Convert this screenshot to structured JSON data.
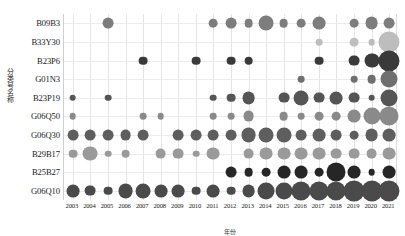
{
  "chart_data": {
    "type": "scatter",
    "title": "",
    "xlabel": "年份",
    "ylabel": "分类号名称",
    "x": [
      "2003",
      "2004",
      "2005",
      "2006",
      "2007",
      "2008",
      "2009",
      "2010",
      "2011",
      "2012",
      "2013",
      "2014",
      "2015",
      "2016",
      "2017",
      "2018",
      "2019",
      "2020",
      "2021"
    ],
    "categories": [
      "B09B3",
      "B33Y30",
      "B23P6",
      "G01N3",
      "B23P19",
      "G06Q50",
      "G06Q30",
      "B29B17",
      "B25B27",
      "G06Q10"
    ],
    "grid": true,
    "legend": null,
    "note": "Bubble size encodes count; bubble darkness encodes series/row grouping.",
    "series": [
      {
        "name": "B09B3",
        "row": 0,
        "color": "#7d7d7d",
        "points": [
          {
            "x": "2005",
            "v": 4
          },
          {
            "x": "2011",
            "v": 3
          },
          {
            "x": "2012",
            "v": 4
          },
          {
            "x": "2013",
            "v": 3
          },
          {
            "x": "2014",
            "v": 6
          },
          {
            "x": "2015",
            "v": 3
          },
          {
            "x": "2016",
            "v": 3
          },
          {
            "x": "2017",
            "v": 5
          },
          {
            "x": "2019",
            "v": 3
          },
          {
            "x": "2020",
            "v": 5
          },
          {
            "x": "2021",
            "v": 4
          }
        ]
      },
      {
        "name": "B33Y30",
        "row": 1,
        "color": "#bdbdbd",
        "points": [
          {
            "x": "2017",
            "v": 2
          },
          {
            "x": "2019",
            "v": 3
          },
          {
            "x": "2020",
            "v": 2
          },
          {
            "x": "2021",
            "v": 9
          }
        ]
      },
      {
        "name": "B23P6",
        "row": 2,
        "color": "#3a3a3a",
        "points": [
          {
            "x": "2007",
            "v": 3
          },
          {
            "x": "2010",
            "v": 3
          },
          {
            "x": "2012",
            "v": 3
          },
          {
            "x": "2013",
            "v": 3
          },
          {
            "x": "2017",
            "v": 3
          },
          {
            "x": "2019",
            "v": 4
          },
          {
            "x": "2020",
            "v": 6
          },
          {
            "x": "2021",
            "v": 9
          }
        ]
      },
      {
        "name": "G01N3",
        "row": 3,
        "color": "#6f6f6f",
        "points": [
          {
            "x": "2016",
            "v": 2
          },
          {
            "x": "2019",
            "v": 2
          },
          {
            "x": "2020",
            "v": 3
          },
          {
            "x": "2021",
            "v": 7
          }
        ]
      },
      {
        "name": "B23P19",
        "row": 4,
        "color": "#555555",
        "points": [
          {
            "x": "2003",
            "v": 2
          },
          {
            "x": "2005",
            "v": 2
          },
          {
            "x": "2011",
            "v": 2
          },
          {
            "x": "2012",
            "v": 3
          },
          {
            "x": "2013",
            "v": 5
          },
          {
            "x": "2015",
            "v": 4
          },
          {
            "x": "2016",
            "v": 6
          },
          {
            "x": "2017",
            "v": 4
          },
          {
            "x": "2018",
            "v": 5
          },
          {
            "x": "2019",
            "v": 4
          },
          {
            "x": "2020",
            "v": 2
          },
          {
            "x": "2021",
            "v": 7
          }
        ]
      },
      {
        "name": "G06Q50",
        "row": 5,
        "color": "#8a8a8a",
        "points": [
          {
            "x": "2003",
            "v": 2
          },
          {
            "x": "2007",
            "v": 2
          },
          {
            "x": "2008",
            "v": 2
          },
          {
            "x": "2011",
            "v": 2
          },
          {
            "x": "2012",
            "v": 2
          },
          {
            "x": "2013",
            "v": 4
          },
          {
            "x": "2015",
            "v": 3
          },
          {
            "x": "2016",
            "v": 2
          },
          {
            "x": "2017",
            "v": 3
          },
          {
            "x": "2018",
            "v": 3
          },
          {
            "x": "2019",
            "v": 5
          },
          {
            "x": "2020",
            "v": 7
          },
          {
            "x": "2021",
            "v": 8
          }
        ]
      },
      {
        "name": "G06Q30",
        "row": 6,
        "color": "#5e5e5e",
        "points": [
          {
            "x": "2003",
            "v": 4
          },
          {
            "x": "2004",
            "v": 4
          },
          {
            "x": "2005",
            "v": 4
          },
          {
            "x": "2006",
            "v": 4
          },
          {
            "x": "2007",
            "v": 4
          },
          {
            "x": "2009",
            "v": 4
          },
          {
            "x": "2010",
            "v": 4
          },
          {
            "x": "2011",
            "v": 4
          },
          {
            "x": "2012",
            "v": 4
          },
          {
            "x": "2013",
            "v": 6
          },
          {
            "x": "2014",
            "v": 6
          },
          {
            "x": "2015",
            "v": 6
          },
          {
            "x": "2016",
            "v": 4
          },
          {
            "x": "2017",
            "v": 5
          },
          {
            "x": "2018",
            "v": 4
          },
          {
            "x": "2019",
            "v": 3
          },
          {
            "x": "2020",
            "v": 5
          },
          {
            "x": "2021",
            "v": 5
          }
        ]
      },
      {
        "name": "B29B17",
        "row": 7,
        "color": "#9a9a9a",
        "points": [
          {
            "x": "2003",
            "v": 3
          },
          {
            "x": "2004",
            "v": 6
          },
          {
            "x": "2005",
            "v": 2
          },
          {
            "x": "2006",
            "v": 3
          },
          {
            "x": "2008",
            "v": 4
          },
          {
            "x": "2009",
            "v": 4
          },
          {
            "x": "2010",
            "v": 2
          },
          {
            "x": "2011",
            "v": 5
          },
          {
            "x": "2013",
            "v": 4
          },
          {
            "x": "2014",
            "v": 5
          },
          {
            "x": "2015",
            "v": 5
          },
          {
            "x": "2016",
            "v": 5
          },
          {
            "x": "2017",
            "v": 5
          },
          {
            "x": "2018",
            "v": 4
          },
          {
            "x": "2019",
            "v": 4
          },
          {
            "x": "2020",
            "v": 4
          },
          {
            "x": "2021",
            "v": 5
          }
        ]
      },
      {
        "name": "B25B27",
        "row": 8,
        "color": "#262626",
        "points": [
          {
            "x": "2012",
            "v": 4
          },
          {
            "x": "2013",
            "v": 3
          },
          {
            "x": "2014",
            "v": 3
          },
          {
            "x": "2015",
            "v": 5
          },
          {
            "x": "2016",
            "v": 5
          },
          {
            "x": "2017",
            "v": 3
          },
          {
            "x": "2018",
            "v": 8
          },
          {
            "x": "2019",
            "v": 5
          },
          {
            "x": "2020",
            "v": 2
          },
          {
            "x": "2021",
            "v": 5
          }
        ]
      },
      {
        "name": "G06Q10",
        "row": 9,
        "color": "#4a4a4a",
        "points": [
          {
            "x": "2003",
            "v": 5
          },
          {
            "x": "2004",
            "v": 4
          },
          {
            "x": "2005",
            "v": 3
          },
          {
            "x": "2006",
            "v": 6
          },
          {
            "x": "2007",
            "v": 6
          },
          {
            "x": "2008",
            "v": 5
          },
          {
            "x": "2009",
            "v": 5
          },
          {
            "x": "2010",
            "v": 3
          },
          {
            "x": "2011",
            "v": 5
          },
          {
            "x": "2012",
            "v": 3
          },
          {
            "x": "2013",
            "v": 5
          },
          {
            "x": "2014",
            "v": 7
          },
          {
            "x": "2015",
            "v": 7
          },
          {
            "x": "2016",
            "v": 8
          },
          {
            "x": "2017",
            "v": 8
          },
          {
            "x": "2018",
            "v": 8
          },
          {
            "x": "2019",
            "v": 9
          },
          {
            "x": "2020",
            "v": 9
          },
          {
            "x": "2021",
            "v": 9
          }
        ]
      }
    ]
  },
  "axes": {
    "y_title": "分类号名称",
    "x_title": "年份"
  }
}
